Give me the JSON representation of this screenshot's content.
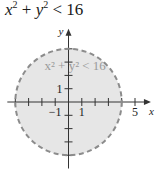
{
  "chart_data": {
    "type": "region",
    "title": "x² + y² < 16",
    "title_parts": {
      "x": "x",
      "y": "y",
      "exp": "2",
      "plus": "+",
      "rel": "<",
      "rhs": "16"
    },
    "inequality": "x^2 + y^2 < 16",
    "region": {
      "shape": "circle",
      "center": [
        0,
        0
      ],
      "radius": 4,
      "boundary": "dashed",
      "fill": "inside"
    },
    "inner_label": "x² + y² < 16",
    "xlabel": "x",
    "ylabel": "y",
    "xlim": [
      -5,
      6.2
    ],
    "ylim": [
      -5,
      5.5
    ],
    "x_ticks": [
      -4,
      -3,
      -2,
      -1,
      1,
      2,
      3,
      4,
      5
    ],
    "y_ticks": [
      -4,
      -3,
      -2,
      -1,
      1,
      2,
      3,
      4
    ],
    "x_tick_labels": [
      {
        "value": -1,
        "text": "−1"
      },
      {
        "value": 1,
        "text": "1"
      },
      {
        "value": 5,
        "text": "5"
      }
    ],
    "y_tick_labels": [
      {
        "value": 1,
        "text": "1"
      }
    ],
    "colors": {
      "fill": "#e6e6e6",
      "boundary": "#8c8c8c",
      "axis": "#333333",
      "inner_label": "#9a9a9a"
    }
  }
}
